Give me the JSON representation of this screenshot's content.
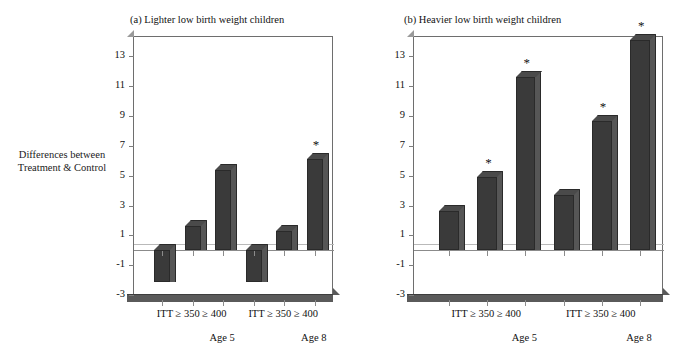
{
  "figure": {
    "ylabel_line1": "Differences between",
    "ylabel_line2": "Treatment & Control"
  },
  "chart_data": [
    {
      "type": "bar",
      "title": "(a) Lighter low birth weight children",
      "xlabel": "",
      "ylabel": "Differences between Treatment & Control",
      "ylim": [
        -3,
        14.3
      ],
      "yticks": [
        -3,
        -1,
        1,
        3,
        5,
        7,
        9,
        11,
        13
      ],
      "ytick_labels": [
        "-3",
        "-1",
        "1",
        "3",
        "5",
        "7",
        "9",
        "11",
        "13"
      ],
      "grid": false,
      "legend": "none",
      "groups": [
        "Age 5",
        "Age 8"
      ],
      "categories": [
        "ITT",
        "≥ 350",
        "≥ 400"
      ],
      "bars": [
        {
          "group": "Age 5",
          "category": "ITT",
          "value": -2.1,
          "significant": false
        },
        {
          "group": "Age 5",
          "category": "≥ 350",
          "value": 1.6,
          "significant": false
        },
        {
          "group": "Age 5",
          "category": "≥ 400",
          "value": 5.4,
          "significant": false
        },
        {
          "group": "Age 8",
          "category": "ITT",
          "value": -2.1,
          "significant": false
        },
        {
          "group": "Age 8",
          "category": "≥ 350",
          "value": 1.3,
          "significant": false
        },
        {
          "group": "Age 8",
          "category": "≥ 400",
          "value": 6.1,
          "significant": true
        }
      ],
      "significance_marker": "*"
    },
    {
      "type": "bar",
      "title": "(b) Heavier low birth weight children",
      "xlabel": "",
      "ylabel": "Differences between Treatment & Control",
      "ylim": [
        -3,
        14.3
      ],
      "yticks": [
        -3,
        -1,
        1,
        3,
        5,
        7,
        9,
        11,
        13
      ],
      "ytick_labels": [
        "-3",
        "-1",
        "1",
        "3",
        "5",
        "7",
        "9",
        "11",
        "13"
      ],
      "grid": false,
      "legend": "none",
      "groups": [
        "Age 5",
        "Age 8"
      ],
      "categories": [
        "ITT",
        "≥ 350",
        "≥ 400"
      ],
      "bars": [
        {
          "group": "Age 5",
          "category": "ITT",
          "value": 2.6,
          "significant": false
        },
        {
          "group": "Age 5",
          "category": "≥ 350",
          "value": 4.9,
          "significant": true
        },
        {
          "group": "Age 5",
          "category": "≥ 400",
          "value": 11.6,
          "significant": true
        },
        {
          "group": "Age 8",
          "category": "ITT",
          "value": 3.7,
          "significant": false
        },
        {
          "group": "Age 8",
          "category": "≥ 350",
          "value": 8.7,
          "significant": true
        },
        {
          "group": "Age 8",
          "category": "≥ 400",
          "value": 14.1,
          "significant": true
        }
      ],
      "significance_marker": "*"
    }
  ],
  "panels": [
    {
      "id": "panel-a",
      "title": "(a) Lighter low birth weight children",
      "xcat_labels": [
        "ITT ≥ 350 ≥ 400",
        "ITT ≥ 350 ≥ 400"
      ],
      "xgroup_labels": [
        "Age 5",
        "Age 8"
      ]
    },
    {
      "id": "panel-b",
      "title": "(b) Heavier low birth weight children",
      "xcat_labels": [
        "ITT ≥ 350 ≥ 400",
        "ITT ≥ 350 ≥ 400"
      ],
      "xgroup_labels": [
        "Age 5",
        "Age 8"
      ]
    }
  ],
  "colors": {
    "bar_face": "#3a3a3a",
    "bar_side": "#565656",
    "bar_top": "#4a4a4a",
    "axis": "#6e6e6e",
    "floor": "#5a5a5a",
    "text": "#111111",
    "background": "#ffffff"
  }
}
